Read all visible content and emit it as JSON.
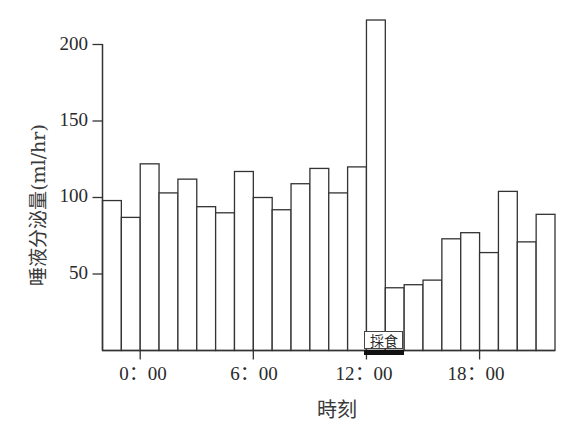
{
  "chart_data": {
    "type": "bar",
    "title": "",
    "xlabel": "時刻",
    "ylabel": "唾液分泌量(ml/hr)",
    "ylim": [
      0,
      200
    ],
    "yticks": [
      50,
      100,
      150,
      200
    ],
    "grid": false,
    "legend": null,
    "categories": [
      "22:00",
      "23:00",
      "0:00",
      "1:00",
      "2:00",
      "3:00",
      "4:00",
      "5:00",
      "6:00",
      "7:00",
      "8:00",
      "9:00",
      "10:00",
      "11:00",
      "12:00",
      "13:00",
      "14:00",
      "15:00",
      "16:00",
      "17:00",
      "18:00",
      "19:00",
      "20:00",
      "21:00"
    ],
    "values": [
      98,
      87,
      122,
      103,
      112,
      94,
      90,
      117,
      100,
      92,
      109,
      119,
      103,
      120,
      216,
      41,
      43,
      46,
      73,
      77,
      64,
      104,
      71,
      89
    ],
    "xtick_labels": [
      {
        "label": "0：00",
        "bar_index": 2
      },
      {
        "label": "6：00",
        "bar_index": 8
      },
      {
        "label": "12：00",
        "bar_index": 14
      },
      {
        "label": "18：00",
        "bar_index": 20
      }
    ],
    "annotations": [
      {
        "text": "採食",
        "start_bar_index": 14,
        "end_bar_index": 15,
        "style": "boxed label with thick black bar under x-axis"
      }
    ]
  },
  "axes": {
    "y_ticks": [
      "50",
      "100",
      "150",
      "200"
    ],
    "x_ticks": [
      "0：00",
      "6：00",
      "12：00",
      "18：00"
    ],
    "x_title": "時刻",
    "y_title": "唾液分泌量(ml/hr)"
  },
  "annotation": {
    "feeding_label": "採食"
  },
  "colors": {
    "bar_fill": "#ffffff",
    "bar_stroke": "#333333",
    "axis": "#333333",
    "feeding_bar": "#111111"
  }
}
